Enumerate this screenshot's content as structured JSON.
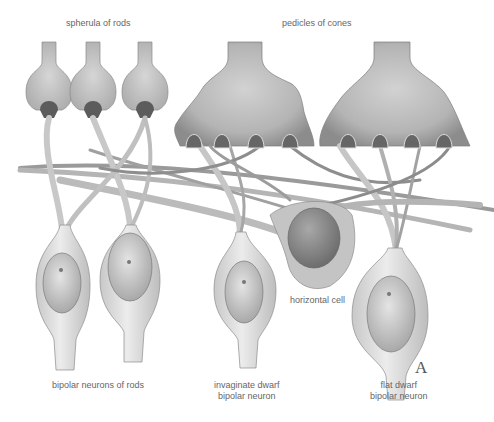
{
  "figure": {
    "panel_letter": "A",
    "labels": {
      "spherula_of_rods": "spherula of rods",
      "pedicles_of_cones": "pedicles of cones",
      "horizontal_cell": "horizontal cell",
      "bipolar_neurons_of_rods": "bipolar neurons of rods",
      "invaginate_dwarf_line1": "invaginate dwarf",
      "invaginate_dwarf_line2": "bipolar neuron",
      "flat_dwarf_line1": "flat dwarf",
      "flat_dwarf_line2": "bipolar neuron"
    },
    "colors": {
      "terminal_fill": "#b8b8b8",
      "terminal_dark": "#8a8a8a",
      "cell_body": "#dcdcdc",
      "nucleus": "#c4c4c4",
      "horizontal_nucleus": "#8e8e8e",
      "fiber": "#9a9a9a",
      "outline": "#707070"
    }
  }
}
